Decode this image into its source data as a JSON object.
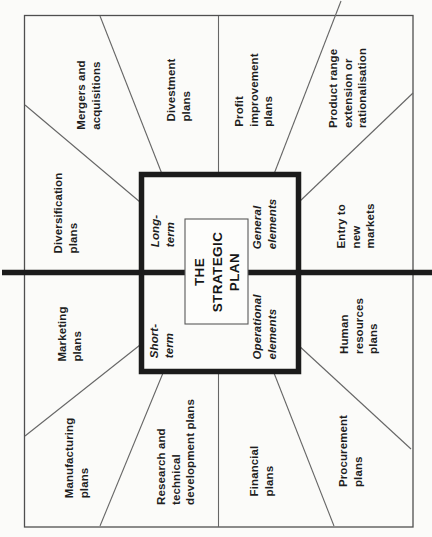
{
  "diagram": {
    "title": "THE\nSTRATEGIC\nPLAN",
    "quadrants": {
      "long_term": "Long-\nterm",
      "general": "General\nelements",
      "short_term": "Short-\nterm",
      "operational": "Operational\nelements"
    },
    "segments": [
      {
        "label": "Mergers and\nacquisitions"
      },
      {
        "label": "Divestment\nplans"
      },
      {
        "label": "Profit\nimprovement\nplans"
      },
      {
        "label": "Product range\nextension or\nrationalisation"
      },
      {
        "label": "Diversification\nplans"
      },
      {
        "label": "Entry to\nnew\nmarkets"
      },
      {
        "label": "Marketing\nplans"
      },
      {
        "label": "Human\nresources\nplans"
      },
      {
        "label": "Manufacturing\nplans"
      },
      {
        "label": "Research and\ntechnical\ndevelopment plans"
      },
      {
        "label": "Financial\nplans"
      },
      {
        "label": "Procurement\nplans"
      }
    ],
    "colors": {
      "paper": "#fbfbf9",
      "thin_line": "#666666",
      "border_line": "#4f4f4f",
      "thick_line": "#1b1b1b",
      "text": "#1e1e1e"
    }
  }
}
